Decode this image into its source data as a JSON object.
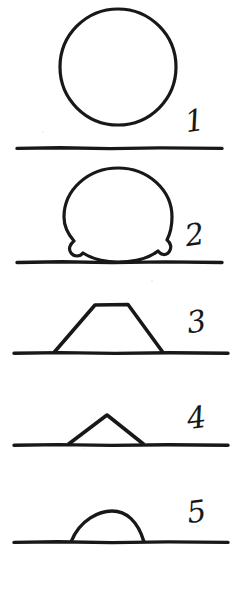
{
  "plate": {
    "background_color": "#ffffff",
    "ink_color": "#181818",
    "width": 241,
    "height": 598
  },
  "figures": [
    {
      "number_label": "1",
      "shape_name": "full-circle-above-horizon",
      "description": "Full round sun disc resting above a horizontal horizon line",
      "number_x": 196,
      "number_y": 131,
      "baseline_y": 148,
      "baseline_x1": 17,
      "baseline_x2": 222
    },
    {
      "number_label": "2",
      "shape_name": "lumpy-circle-on-horizon",
      "description": "Slightly irregular, lumpy sun disc sitting on the horizon line",
      "number_x": 196,
      "number_y": 245,
      "baseline_y": 262,
      "baseline_x1": 17,
      "baseline_x2": 222
    },
    {
      "number_label": "3",
      "shape_name": "trapezoid-on-horizon",
      "description": "Flat-topped trapezoidal sun shape on the horizon line",
      "number_x": 198,
      "number_y": 332,
      "baseline_y": 353,
      "baseline_x1": 14,
      "baseline_x2": 228
    },
    {
      "number_label": "4",
      "shape_name": "triangle-on-horizon",
      "description": "Pointed triangular sun shape on the horizon line",
      "number_x": 198,
      "number_y": 428,
      "baseline_y": 445,
      "baseline_x1": 14,
      "baseline_x2": 228
    },
    {
      "number_label": "5",
      "shape_name": "flattened-dome-on-horizon",
      "description": "Low flattened dome / segment of sun remaining on the horizon line",
      "number_x": 198,
      "number_y": 522,
      "baseline_y": 542,
      "baseline_x1": 14,
      "baseline_x2": 228
    }
  ],
  "caption": {
    "text": "崎真左眼中，红海太阳的",
    "note_visible": "partially cropped line of body text at bottom edge"
  }
}
